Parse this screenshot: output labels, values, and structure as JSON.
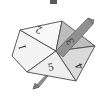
{
  "figure": {
    "title": "",
    "type": "polygon-spinner-diagram",
    "background_color": "#ffffff",
    "outline_color": "#4a4a4a",
    "label_color": "#2b2b2b"
  },
  "facets": [
    {
      "id": "facet-1",
      "label": "1",
      "fill": "#f4f4f4",
      "rotation": -105,
      "cx": 23,
      "cy": 47
    },
    {
      "id": "facet-2",
      "label": "2",
      "fill": "#f7f7f7",
      "rotation": -160,
      "cx": 39,
      "cy": 28
    },
    {
      "id": "facet-3",
      "label": "3",
      "fill": "#bdbdbd",
      "rotation": -118,
      "cx": 71,
      "cy": 41
    },
    {
      "id": "facet-4",
      "label": "4",
      "fill": "#d9d9d9",
      "rotation": -115,
      "cx": 80,
      "cy": 66
    },
    {
      "id": "facet-5",
      "label": "5",
      "fill": "#ededed",
      "rotation": -10,
      "cx": 51,
      "cy": 68
    }
  ],
  "pencil": {
    "id": "pencil",
    "shaft_color": "#9a9a9a",
    "tip_color": "#8a8a8a",
    "top_end": {
      "x": 93,
      "y": 20
    },
    "bottom_end": {
      "x": 33,
      "y": 88
    }
  },
  "top_artifact": {
    "id": "crop-artifact",
    "color": "#5a5a5a",
    "x": 50,
    "y": 0,
    "width": 7,
    "height": 4
  },
  "geometry": {
    "center": {
      "x": 56,
      "y": 51
    },
    "vertices": [
      {
        "x": 20,
        "y": 30
      },
      {
        "x": 62,
        "y": 21
      },
      {
        "x": 95,
        "y": 46
      },
      {
        "x": 76,
        "y": 81
      },
      {
        "x": 27,
        "y": 72
      },
      {
        "x": 12,
        "y": 56
      }
    ]
  }
}
